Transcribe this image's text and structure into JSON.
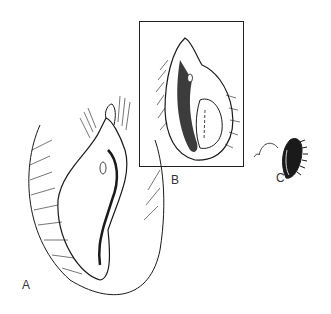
{
  "figure": {
    "panels": [
      {
        "id": "A",
        "label": "A",
        "description": "main anatomical illustration"
      },
      {
        "id": "B",
        "label": "B",
        "description": "boxed inset illustration"
      },
      {
        "id": "C",
        "label": "C",
        "description": "small excised specimen with sutures"
      }
    ],
    "colors": {
      "ink": "#1a1a1a",
      "background": "#ffffff"
    }
  }
}
